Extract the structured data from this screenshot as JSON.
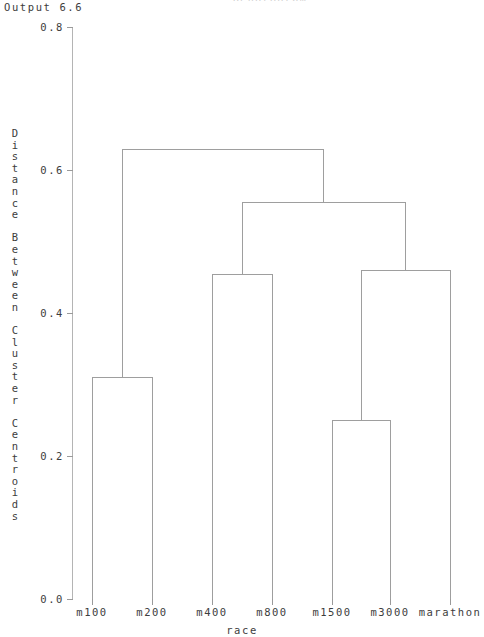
{
  "window": {
    "output_label": "Output 6.6",
    "title_partial": "Dendrogram"
  },
  "chart_data": {
    "type": "dendrogram",
    "title": "",
    "xlabel": "race",
    "ylabel": "Distance Between Cluster Centroids",
    "ylabel_chars": [
      "D",
      "i",
      "s",
      "t",
      "a",
      "n",
      "c",
      "e",
      "",
      "B",
      "e",
      "t",
      "w",
      "e",
      "e",
      "n",
      "",
      "C",
      "l",
      "u",
      "s",
      "t",
      "e",
      "r",
      "",
      "C",
      "e",
      "n",
      "t",
      "r",
      "o",
      "i",
      "d",
      "s"
    ],
    "ylim": [
      0.0,
      0.8
    ],
    "yticks": [
      0.0,
      0.2,
      0.4,
      0.6,
      0.8
    ],
    "ytick_labels": [
      "0.0",
      "0.2",
      "0.4",
      "0.6",
      "0.8"
    ],
    "leaves": [
      "m100",
      "m200",
      "m400",
      "m800",
      "m1500",
      "m3000",
      "marathon"
    ],
    "leaf_positions": [
      92,
      152,
      212,
      272,
      332,
      390,
      450
    ],
    "grid": false,
    "legend": null,
    "line_color": "#9e9e9e",
    "merges": [
      {
        "id": "m100-m200",
        "height": 0.31,
        "left_x": 92,
        "right_x": 152,
        "center_x": 122
      },
      {
        "id": "m400-m800",
        "height": 0.455,
        "left_x": 212,
        "right_x": 272,
        "center_x": 242
      },
      {
        "id": "m1500-m3000",
        "height": 0.25,
        "left_x": 332,
        "right_x": 390,
        "center_x": 361
      },
      {
        "id": "m1500-m3000-marathon",
        "height": 0.46,
        "left_x": 361,
        "right_x": 450,
        "center_x": 405
      },
      {
        "id": "mid-right-cluster",
        "height": 0.555,
        "left_x": 242,
        "right_x": 405,
        "center_x": 323
      },
      {
        "id": "root",
        "height": 0.63,
        "left_x": 122,
        "right_x": 323,
        "center_x": 222
      }
    ]
  }
}
